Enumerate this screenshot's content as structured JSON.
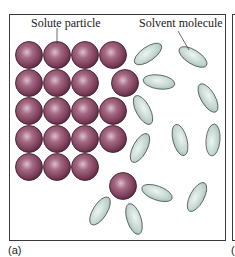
{
  "figure": {
    "panel_label": "(a)",
    "next_panel_label_fragment": "(",
    "labels": {
      "solute": "Solute particle",
      "solvent": "Solvent molecule"
    },
    "colors": {
      "solute_fill": "#8a4a66",
      "solute_highlight": "#d8b8c6",
      "solvent_fill": "#c6d8d2",
      "solvent_stroke": "#4a5a55",
      "frame": "#3a3a3a"
    },
    "solute_particles": [
      {
        "x": 29,
        "y": 55
      },
      {
        "x": 57,
        "y": 55
      },
      {
        "x": 85,
        "y": 55
      },
      {
        "x": 113,
        "y": 55
      },
      {
        "x": 29,
        "y": 83
      },
      {
        "x": 57,
        "y": 83
      },
      {
        "x": 85,
        "y": 83
      },
      {
        "x": 125,
        "y": 83
      },
      {
        "x": 29,
        "y": 111
      },
      {
        "x": 57,
        "y": 111
      },
      {
        "x": 85,
        "y": 111
      },
      {
        "x": 113,
        "y": 111
      },
      {
        "x": 29,
        "y": 139
      },
      {
        "x": 57,
        "y": 139
      },
      {
        "x": 85,
        "y": 139
      },
      {
        "x": 113,
        "y": 139
      },
      {
        "x": 29,
        "y": 167
      },
      {
        "x": 57,
        "y": 167
      },
      {
        "x": 85,
        "y": 167
      },
      {
        "x": 123,
        "y": 186
      }
    ],
    "solvent_molecules": [
      {
        "x": 148,
        "y": 54,
        "rx": 16,
        "ry": 7,
        "rot": -35
      },
      {
        "x": 193,
        "y": 57,
        "rx": 16,
        "ry": 7,
        "rot": 32
      },
      {
        "x": 159,
        "y": 82,
        "rx": 16,
        "ry": 7,
        "rot": 8
      },
      {
        "x": 208,
        "y": 98,
        "rx": 16,
        "ry": 7,
        "rot": 60
      },
      {
        "x": 143,
        "y": 110,
        "rx": 16,
        "ry": 7,
        "rot": 62
      },
      {
        "x": 180,
        "y": 140,
        "rx": 16,
        "ry": 7,
        "rot": 75
      },
      {
        "x": 213,
        "y": 140,
        "rx": 16,
        "ry": 7,
        "rot": -85
      },
      {
        "x": 140,
        "y": 148,
        "rx": 16,
        "ry": 7,
        "rot": -62
      },
      {
        "x": 157,
        "y": 193,
        "rx": 16,
        "ry": 7,
        "rot": 20
      },
      {
        "x": 197,
        "y": 197,
        "rx": 16,
        "ry": 7,
        "rot": -62
      },
      {
        "x": 100,
        "y": 211,
        "rx": 16,
        "ry": 7,
        "rot": -58
      },
      {
        "x": 134,
        "y": 219,
        "rx": 16,
        "ry": 7,
        "rot": 72
      }
    ]
  }
}
